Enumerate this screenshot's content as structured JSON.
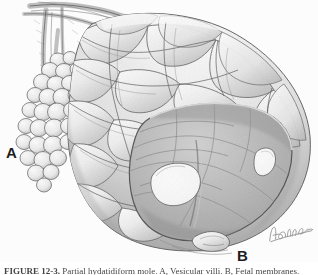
{
  "figure": {
    "type": "medical-illustration",
    "medium": "graphite pencil drawing",
    "background_color": "#ffffff",
    "ink_color": "#4a4a4a",
    "cavity_color": "#b8b8b8",
    "highlight_color": "#fdfdfd",
    "label_color": "#1d1d1d"
  },
  "labels": {
    "a": "A",
    "b": "B"
  },
  "signature": {
    "artist_mark": "artist-signature"
  },
  "caption": {
    "number": "FIGURE 12-3.",
    "text": "Partial hydatidiform mole. A, Vesicular villi. B, Fetal membranes."
  },
  "regions": {
    "vesicular_cluster": "grape-like vesicle cluster",
    "tubal_structure": "fallopian tube and vessels",
    "uterine_body": "convoluted lobulated uterine body",
    "interior_cavity": "opened interior cavity",
    "ostium_left": "large oval opening",
    "ostium_right": "small angular opening",
    "cervix_nub": "inferior protrusion"
  }
}
